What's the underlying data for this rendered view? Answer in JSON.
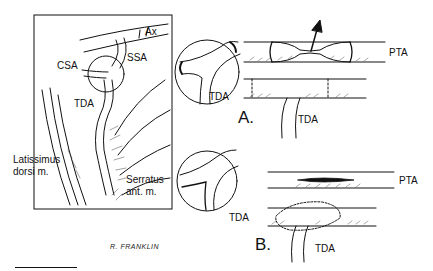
{
  "figure": {
    "overview_panel": {
      "labels": {
        "ax": "Ax",
        "ssa": "SSA",
        "csa": "CSA",
        "tda": "TDA",
        "latissimus_line1": "Latissimus",
        "latissimus_line2": "dorsi m.",
        "serratus_line1": "Serratus",
        "serratus_line2": "ant. m."
      },
      "signature": "R. FRANKLIN"
    },
    "panel_a": {
      "letter": "A.",
      "inset_label": "TDA",
      "upper_vessel_label": "PTA",
      "lower_vessel_label": "TDA"
    },
    "panel_b": {
      "letter": "B.",
      "inset_label": "TDA",
      "upper_vessel_label": "PTA",
      "lower_vessel_label": "TDA"
    }
  },
  "colors": {
    "ink": "#111111",
    "background": "#ffffff"
  }
}
